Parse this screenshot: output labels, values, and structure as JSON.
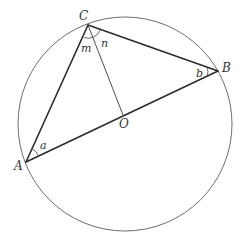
{
  "figure": {
    "points": {
      "A": {
        "label": "A"
      },
      "B": {
        "label": "B"
      },
      "C": {
        "label": "C"
      },
      "O": {
        "label": "O"
      }
    },
    "angles": {
      "a": {
        "label": "a",
        "vertex": "A"
      },
      "b": {
        "label": "b",
        "vertex": "B"
      },
      "m": {
        "label": "m",
        "vertex": "C",
        "between": "CA-CO"
      },
      "n": {
        "label": "n",
        "vertex": "C",
        "between": "CO-CB"
      }
    },
    "segments": [
      "AB",
      "AC",
      "BC",
      "CO"
    ]
  }
}
